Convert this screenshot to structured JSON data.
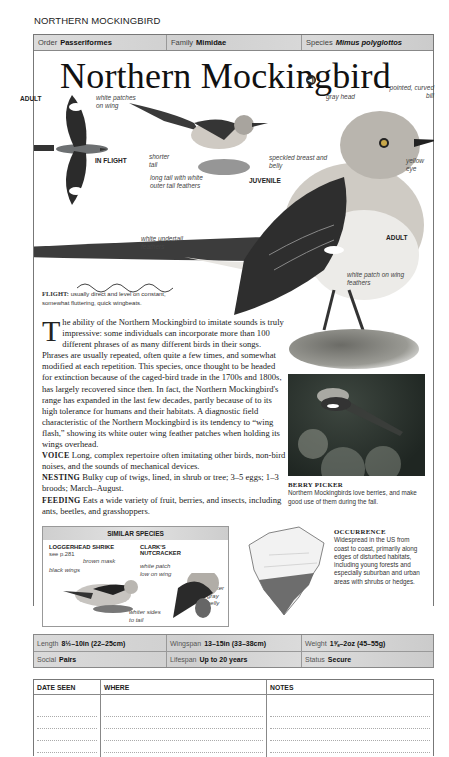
{
  "running_head": "NORTHERN MOCKINGBIRD",
  "taxonomy": {
    "order_label": "Order",
    "order": "Passeriformes",
    "family_label": "Family",
    "family": "Mimidae",
    "species_label": "Species",
    "species": "Mimus polyglottos"
  },
  "title": "Northern Mockingbird",
  "audio_icon": "◀)",
  "illustration_labels": {
    "flight_adult": "ADULT",
    "white_patches": "white patches on wing",
    "in_flight": "IN FLIGHT",
    "shorter_tail": "shorter tail",
    "speckled": "speckled breast and belly",
    "juvenile": "JUVENILE",
    "long_tail": "long tail with white outer tail feathers",
    "gray_head": "gray head",
    "pointed_bill": "pointed, curved bill",
    "yellow_eye": "yellow eye",
    "adult": "ADULT",
    "white_undertail": "white undertail feathers",
    "white_patch": "white patch on wing feathers"
  },
  "flight": {
    "label": "FLIGHT:",
    "text": "usually direct and level on constant, somewhat fluttering, quick wingbeats."
  },
  "description": {
    "dropcap": "T",
    "intro": "he ability of the Northern Mockingbird to imitate sounds is truly impressive: some individuals can incorporate more than 100 different phrases of as many different birds in their songs. Phrases are usually repeated, often quite a few times, and somewhat modified at each repetition. This species, once thought to be headed for extinction because of the caged-bird trade in the 1700s and 1800s, has largely recovered since then. In fact, the Northern Mockingbird's range has expanded in the last few decades, partly because of to its high tolerance for humans and their habitats. A diagnostic field characteristic of the Northern Mockingbird is its tendency to “wing flash,” showing its white outer wing feather patches when holding its wings overhead.",
    "voice_label": "VOICE",
    "voice": "Long, complex repertoire often imitating other birds, non-bird noises, and the sounds of mechanical devices.",
    "nesting_label": "NESTING",
    "nesting": "Bulky cup of twigs, lined, in shrub or tree; 3–5 eggs; 1–3 broods; March–August.",
    "feeding_label": "FEEDING",
    "feeding": "Eats a wide variety of fruit, berries, and insects, including ants, beetles, and grasshoppers."
  },
  "photo": {
    "title": "BERRY PICKER",
    "caption": "Northern Mockingbirds love berries, and make good use of them during the fall."
  },
  "similar_species": {
    "heading": "SIMILAR SPECIES",
    "species": [
      {
        "name": "LOGGERHEAD SHRIKE",
        "ref": "see p.281",
        "labels": [
          "brown mask",
          "black wings"
        ]
      },
      {
        "name": "CLARK'S NUTCRACKER",
        "ref": "",
        "labels": [
          "white patch low on wing",
          "darker gray belly",
          "whiter sides to tail"
        ]
      }
    ]
  },
  "occurrence": {
    "title": "OCCURRENCE",
    "text": "Widespread in the US from coast to coast, primarily along edges of disturbed habitats, including young forests and especially suburban and urban areas with shrubs or hedges."
  },
  "stats": {
    "length_label": "Length",
    "length": "8½–10in (22–25cm)",
    "wingspan_label": "Wingspan",
    "wingspan": "13–15in (33–38cm)",
    "weight_label": "Weight",
    "weight": "1⅝–2oz (45–55g)",
    "social_label": "Social",
    "social": "Pairs",
    "lifespan_label": "Lifespan",
    "lifespan": "Up to 20 years",
    "status_label": "Status",
    "status": "Secure"
  },
  "log": {
    "columns": [
      "DATE SEEN",
      "WHERE",
      "NOTES"
    ]
  }
}
